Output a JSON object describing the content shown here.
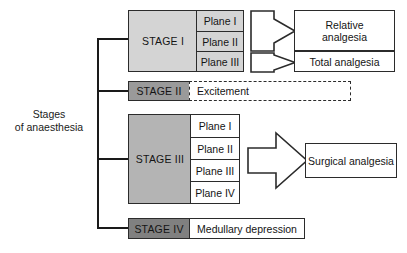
{
  "diagram": {
    "title": "Stages of anaesthesia",
    "root_label_line1": "Stages",
    "root_label_line2": "of anaesthesia",
    "colors": {
      "stage_i_fill": "#d4d4d4",
      "stage_ii_fill": "#9a9a9a",
      "stage_iii_fill": "#b4b4b4",
      "stage_iv_fill": "#808080",
      "plane_i_ii_fill": "#d4d4d4",
      "white_fill": "#ffffff",
      "stroke": "#2b2b2b",
      "text": "#141414"
    },
    "stages": [
      {
        "id": "stage-1",
        "label": "STAGE I",
        "fill": "#d4d4d4",
        "planes": [
          {
            "label": "Plane I",
            "fill": "#d4d4d4"
          },
          {
            "label": "Plane II",
            "fill": "#d4d4d4"
          },
          {
            "label": "Plane III",
            "fill": "#d4d4d4"
          }
        ],
        "outcomes": [
          {
            "label_line1": "Relative",
            "label_line2": "analgesia",
            "label": "Relative analgesia"
          },
          {
            "label_line1": "Total analgesia",
            "label_line2": "",
            "label": "Total analgesia"
          }
        ]
      },
      {
        "id": "stage-2",
        "label": "STAGE II",
        "fill": "#9a9a9a",
        "planes": [],
        "outcomes": [
          {
            "label": "Excitement",
            "style": "dashed"
          }
        ]
      },
      {
        "id": "stage-3",
        "label": "STAGE III",
        "fill": "#b4b4b4",
        "planes": [
          {
            "label": "Plane I",
            "fill": "#ffffff"
          },
          {
            "label": "Plane II",
            "fill": "#ffffff"
          },
          {
            "label": "Plane III",
            "fill": "#ffffff"
          },
          {
            "label": "Plane IV",
            "fill": "#ffffff"
          }
        ],
        "outcomes": [
          {
            "label": "Surgical analgesia"
          }
        ]
      },
      {
        "id": "stage-4",
        "label": "STAGE IV",
        "fill": "#808080",
        "planes": [],
        "outcomes": [
          {
            "label": "Medullary depression"
          }
        ]
      }
    ]
  }
}
